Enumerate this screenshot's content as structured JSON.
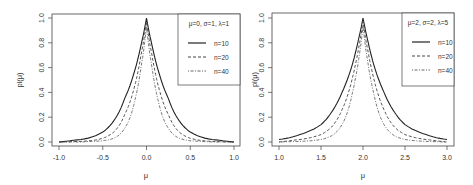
{
  "chart_data": [
    {
      "type": "line",
      "title": "",
      "xlabel": "μ",
      "ylabel": "pl(μ)",
      "xlim": [
        -1.0,
        1.0
      ],
      "ylim": [
        0.0,
        1.0
      ],
      "xticks": [
        "-1.0",
        "-0.5",
        "0.0",
        "0.5",
        "1.0"
      ],
      "yticks": [
        "0.0",
        "0.2",
        "0.4",
        "0.6",
        "0.8",
        "1.0"
      ],
      "legend_title": "μ=0, σ=1, λ=1",
      "legend_position": "top-right",
      "x": [
        -1.0,
        -0.75,
        -0.5,
        -0.375,
        -0.25,
        -0.125,
        -0.0625,
        0.0,
        0.0625,
        0.125,
        0.25,
        0.375,
        0.5,
        0.75,
        1.0
      ],
      "series": [
        {
          "name": "n=10",
          "style": "solid",
          "values": [
            0.0,
            0.02,
            0.08,
            0.17,
            0.35,
            0.6,
            0.78,
            1.0,
            0.78,
            0.6,
            0.35,
            0.17,
            0.08,
            0.02,
            0.0
          ]
        },
        {
          "name": "n=20",
          "style": "dashed",
          "values": [
            0.0,
            0.005,
            0.03,
            0.08,
            0.22,
            0.48,
            0.7,
            0.97,
            0.7,
            0.48,
            0.22,
            0.08,
            0.03,
            0.005,
            0.0
          ]
        },
        {
          "name": "n=40",
          "style": "dotdash",
          "values": [
            0.0,
            0.0,
            0.01,
            0.03,
            0.11,
            0.36,
            0.6,
            0.93,
            0.6,
            0.36,
            0.11,
            0.03,
            0.01,
            0.0,
            0.0
          ]
        }
      ]
    },
    {
      "type": "line",
      "title": "",
      "xlabel": "μ",
      "ylabel": "pl(μ)",
      "xlim": [
        1.0,
        3.0
      ],
      "ylim": [
        0.0,
        1.0
      ],
      "xticks": [
        "1.0",
        "1.5",
        "2.0",
        "2.5",
        "3.0"
      ],
      "yticks": [
        "0.0",
        "0.2",
        "0.4",
        "0.6",
        "0.8",
        "1.0"
      ],
      "legend_title": "μ=2, σ=2, λ=5",
      "legend_position": "top-right",
      "x": [
        1.0,
        1.25,
        1.5,
        1.625,
        1.75,
        1.875,
        1.9375,
        2.0,
        2.0625,
        2.125,
        2.25,
        2.375,
        2.5,
        2.75,
        3.0
      ],
      "series": [
        {
          "name": "n=10",
          "style": "solid",
          "values": [
            0.02,
            0.06,
            0.14,
            0.24,
            0.4,
            0.63,
            0.8,
            1.0,
            0.8,
            0.63,
            0.4,
            0.24,
            0.14,
            0.06,
            0.02
          ]
        },
        {
          "name": "n=20",
          "style": "dashed",
          "values": [
            0.0,
            0.02,
            0.06,
            0.12,
            0.26,
            0.52,
            0.72,
            0.97,
            0.72,
            0.52,
            0.26,
            0.12,
            0.06,
            0.02,
            0.0
          ]
        },
        {
          "name": "n=40",
          "style": "dotdash",
          "values": [
            0.0,
            0.005,
            0.02,
            0.05,
            0.14,
            0.4,
            0.62,
            0.93,
            0.62,
            0.4,
            0.14,
            0.05,
            0.02,
            0.005,
            0.0
          ]
        }
      ]
    }
  ]
}
